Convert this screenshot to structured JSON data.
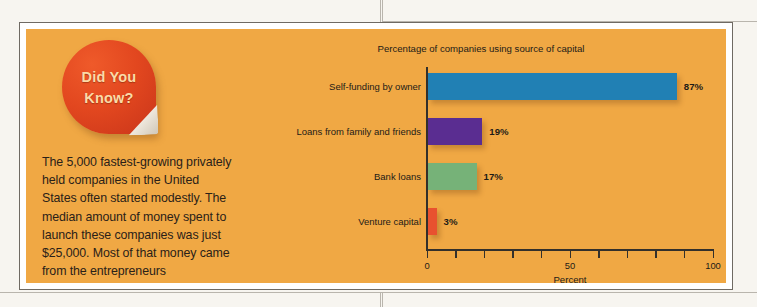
{
  "callout": {
    "badge_line1": "Did You",
    "badge_line2": "Know?",
    "body_text": "The 5,000 fastest-growing privately held companies in the United States often started modestly. The median amount of money spent to launch these companies was just $25,000. Most of that money came from the entrepreneurs themselves.",
    "footnote_marker": "60"
  },
  "chart_data": {
    "type": "bar",
    "orientation": "horizontal",
    "title": "Percentage of companies using source of capital",
    "xlabel": "Percent",
    "ylabel": "",
    "categories": [
      "Self-funding by owner",
      "Loans from family and friends",
      "Bank loans",
      "Venture capital"
    ],
    "values": [
      87,
      19,
      17,
      3
    ],
    "value_labels": [
      "87%",
      "19%",
      "17%",
      "3%"
    ],
    "colors": [
      "#2180b4",
      "#5a2d91",
      "#76b278",
      "#e8512f"
    ],
    "xlim": [
      0,
      100
    ],
    "xticks": [
      0,
      10,
      20,
      30,
      40,
      50,
      60,
      70,
      80,
      90,
      100
    ],
    "xtick_labels": [
      "0",
      "",
      "",
      "",
      "",
      "50",
      "",
      "",
      "",
      "",
      "100"
    ],
    "grid": false,
    "legend": "none"
  },
  "theme": {
    "panel_background": "#f0a844",
    "badge_color": "#e2471f",
    "badge_text_color": "#fbdba8",
    "text_color": "#2a2118",
    "axis_color": "#33302b"
  }
}
